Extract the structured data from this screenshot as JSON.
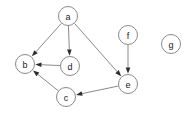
{
  "graph": {
    "title": "Directed Graph",
    "background_color": "#ffffff",
    "node_fill_color": "#ffffff",
    "node_stroke_color": "#8a8a8a",
    "edge_color": "#8a8a8a",
    "arrowhead_color": "#2b2b2b",
    "label_color": "#1a1a1a",
    "node_radius": 9.5,
    "directed": true,
    "nodes": [
      {
        "id": "a",
        "label": "a",
        "x": 68,
        "y": 16
      },
      {
        "id": "b",
        "label": "b",
        "x": 25,
        "y": 64
      },
      {
        "id": "d",
        "label": "d",
        "x": 70,
        "y": 66
      },
      {
        "id": "c",
        "label": "c",
        "x": 66,
        "y": 97
      },
      {
        "id": "e",
        "label": "e",
        "x": 128,
        "y": 84
      },
      {
        "id": "f",
        "label": "f",
        "x": 128,
        "y": 35
      },
      {
        "id": "g",
        "label": "g",
        "x": 171,
        "y": 44
      }
    ],
    "edges": [
      {
        "from": "a",
        "to": "b"
      },
      {
        "from": "a",
        "to": "d"
      },
      {
        "from": "a",
        "to": "e"
      },
      {
        "from": "d",
        "to": "b"
      },
      {
        "from": "c",
        "to": "b"
      },
      {
        "from": "e",
        "to": "c"
      },
      {
        "from": "f",
        "to": "e"
      }
    ],
    "isolated_nodes": [
      "g"
    ]
  }
}
